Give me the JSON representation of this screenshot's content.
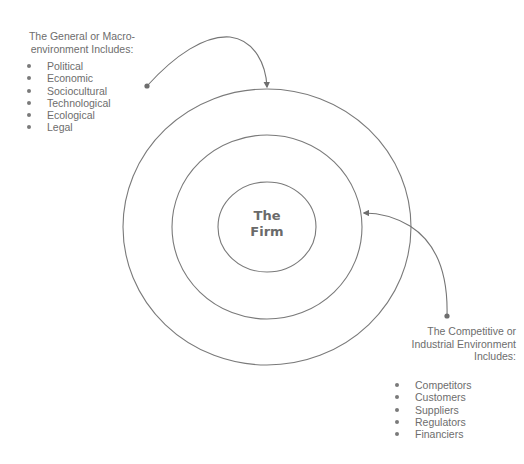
{
  "diagram": {
    "center_label": "The\nFirm",
    "rings": [
      {
        "name": "inner",
        "cx": 267,
        "cy": 227,
        "rx": 49,
        "ry": 45
      },
      {
        "name": "middle",
        "cx": 267,
        "cy": 227,
        "rx": 95,
        "ry": 92
      },
      {
        "name": "outer",
        "cx": 267,
        "cy": 227,
        "rx": 144,
        "ry": 138
      }
    ],
    "line_color": "#7a7a7a"
  },
  "macro": {
    "title": "The General or Macro-\nenvironment Includes:",
    "items": [
      "Political",
      "Economic",
      "Sociocultural",
      "Technological",
      "Ecological",
      "Legal"
    ]
  },
  "micro": {
    "title": "The Competitive or\nIndustrial Environment\nIncludes:",
    "items": [
      "Competitors",
      "Customers",
      "Suppliers",
      "Regulators",
      "Financiers"
    ]
  }
}
